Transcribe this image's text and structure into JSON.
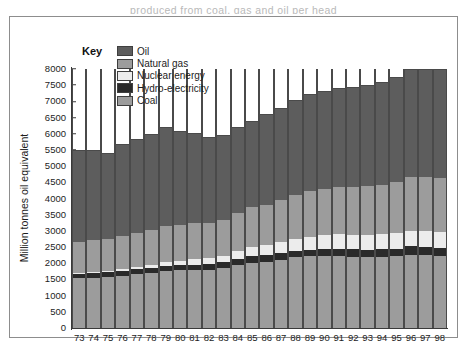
{
  "page": {
    "top_caption_fragment": "produced from coal, gas and oil per head"
  },
  "key": {
    "title": "Key",
    "items": [
      {
        "label": "Oil",
        "color": "#5d5d5d",
        "id": "oil"
      },
      {
        "label": "Natural gas",
        "color": "#9c9c9c",
        "id": "gas"
      },
      {
        "label": "Nuclear energy",
        "color": "#ececec",
        "id": "nuclear"
      },
      {
        "label": "Hydro-electricity",
        "color": "#2a2a2a",
        "id": "hydro"
      },
      {
        "label": "Coal",
        "color": "#9c9c9c",
        "id": "coal"
      }
    ]
  },
  "chart_data": {
    "type": "bar",
    "stacked": true,
    "title": "",
    "xlabel": "",
    "ylabel": "Million tonnes oil equivalent",
    "ylim": [
      0,
      8000
    ],
    "yticks": [
      0,
      500,
      1000,
      1500,
      2000,
      2500,
      3000,
      3500,
      4000,
      4500,
      5000,
      5500,
      6000,
      6500,
      7000,
      7500,
      8000
    ],
    "grid": false,
    "legend_position": "top-left",
    "categories": [
      "73",
      "74",
      "75",
      "76",
      "77",
      "78",
      "79",
      "80",
      "81",
      "82",
      "83",
      "84",
      "85",
      "86",
      "87",
      "88",
      "89",
      "90",
      "91",
      "92",
      "93",
      "94",
      "95",
      "96",
      "97",
      "98"
    ],
    "series": [
      {
        "name": "Coal",
        "color": "#9c9c9c",
        "values": [
          1550,
          1560,
          1580,
          1620,
          1660,
          1690,
          1760,
          1780,
          1790,
          1800,
          1860,
          1950,
          2020,
          2050,
          2110,
          2180,
          2210,
          2230,
          2230,
          2200,
          2180,
          2190,
          2210,
          2270,
          2300,
          2280
        ]
      },
      {
        "name": "Hydro-electricity",
        "color": "#2a2a2a",
        "values": [
          130,
          135,
          140,
          145,
          150,
          155,
          160,
          165,
          170,
          175,
          180,
          190,
          195,
          200,
          205,
          210,
          215,
          220,
          225,
          230,
          235,
          240,
          245,
          250,
          255,
          258
        ]
      },
      {
        "name": "Nuclear energy",
        "color": "#ececec",
        "values": [
          30,
          40,
          55,
          70,
          90,
          110,
          120,
          135,
          160,
          175,
          200,
          240,
          300,
          320,
          350,
          375,
          395,
          420,
          440,
          450,
          455,
          460,
          470,
          485,
          495,
          500
        ]
      },
      {
        "name": "Natural gas",
        "color": "#9c9c9c",
        "values": [
          960,
          980,
          960,
          1010,
          1030,
          1070,
          1120,
          1110,
          1110,
          1090,
          1100,
          1170,
          1210,
          1230,
          1290,
          1350,
          1400,
          1420,
          1450,
          1470,
          1520,
          1530,
          1580,
          1660,
          1690,
          1720
        ]
      },
      {
        "name": "Oil",
        "color": "#5d5d5d",
        "values": [
          2830,
          2785,
          2665,
          2855,
          2920,
          2975,
          3040,
          2910,
          2780,
          2655,
          2610,
          2650,
          2675,
          2800,
          2845,
          2935,
          3000,
          3030,
          3055,
          3100,
          3130,
          3180,
          3235,
          3335,
          3410,
          3440
        ]
      }
    ],
    "totals": [
      5500,
      5500,
      5400,
      5700,
      5850,
      6000,
      6200,
      6100,
      6010,
      5895,
      5950,
      6200,
      6400,
      6600,
      6800,
      7050,
      7220,
      7320,
      7400,
      7450,
      7520,
      7600,
      7740,
      8000,
      8150,
      8196
    ]
  }
}
